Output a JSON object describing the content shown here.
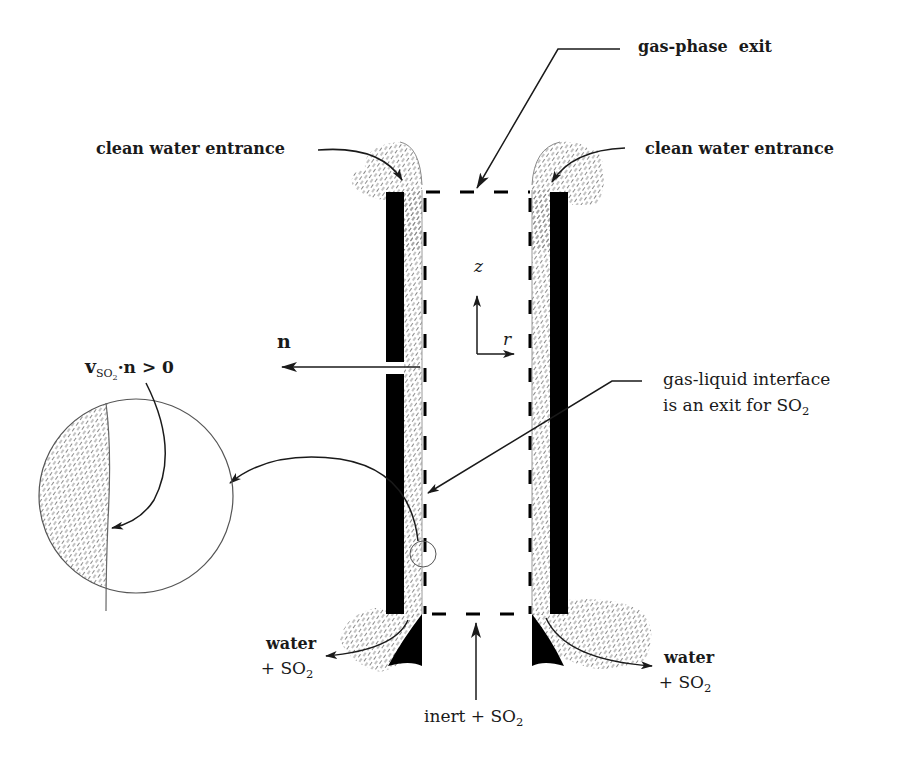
{
  "diagram": {
    "type": "falling-film gas absorber cross-section (wetted-wall column)",
    "colors": {
      "ink": "#1a1a1a",
      "wall": "#000000",
      "liquid_hatch": "#8a8a8a",
      "background": "#ffffff"
    },
    "labels": {
      "gas_phase_exit": "gas-phase  exit",
      "clean_water_entrance_left": "clean water entrance",
      "clean_water_entrance_right": "clean water entrance",
      "axis_z": "z",
      "axis_r": "r",
      "normal_vector": "n",
      "flux_condition": {
        "prefix": "v",
        "subscript_main": "SO",
        "subscript_index": "2",
        "suffix": "·n > 0"
      },
      "interface_line1": "gas-liquid interface",
      "interface_line2_prefix": "is an exit for SO",
      "interface_line2_sub": "2",
      "water_left_line1": "water",
      "water_left_line2_prefix": "+ SO",
      "water_left_line2_sub": "2",
      "water_right_line1": "water",
      "water_right_line2_prefix": "+ SO",
      "water_right_line2_sub": "2",
      "inlet_prefix": "inert + SO",
      "inlet_sub": "2"
    },
    "elements": [
      {
        "name": "left-wall",
        "kind": "solid-black-bar"
      },
      {
        "name": "right-wall",
        "kind": "solid-black-bar"
      },
      {
        "name": "left-liquid-film",
        "kind": "hatched-region"
      },
      {
        "name": "right-liquid-film",
        "kind": "hatched-region"
      },
      {
        "name": "control-volume-boundary",
        "kind": "dashed-rectangle"
      },
      {
        "name": "magnified-interface-view",
        "kind": "circle-inset"
      },
      {
        "name": "coordinate-axes",
        "kind": "z-r-arrows"
      }
    ]
  }
}
